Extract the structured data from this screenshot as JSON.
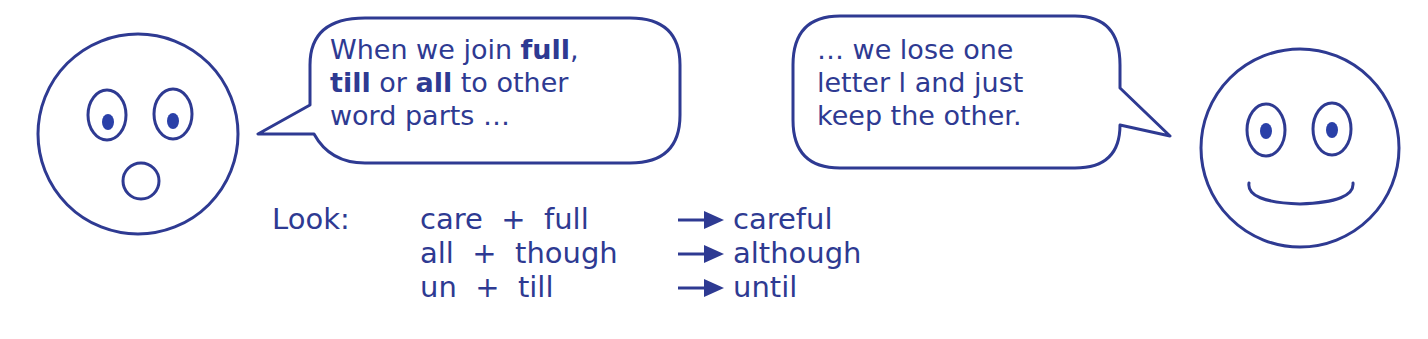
{
  "bubble_left": {
    "lines": [
      [
        "When we join ",
        "full",
        ","
      ],
      [
        "till",
        " or ",
        "all",
        " to other"
      ],
      [
        "word parts …"
      ]
    ]
  },
  "bubble_right": {
    "lines": [
      "… we lose one",
      "letter l and just",
      "keep the other."
    ]
  },
  "examples": {
    "label": "Look:",
    "rows": [
      {
        "parts": "care  +  full",
        "result": "careful"
      },
      {
        "parts": "all  +  though",
        "result": "although"
      },
      {
        "parts": "un  +  till",
        "result": "until"
      }
    ]
  },
  "colors": {
    "ink": "#2e3a92",
    "pupil": "#2a40a8"
  }
}
